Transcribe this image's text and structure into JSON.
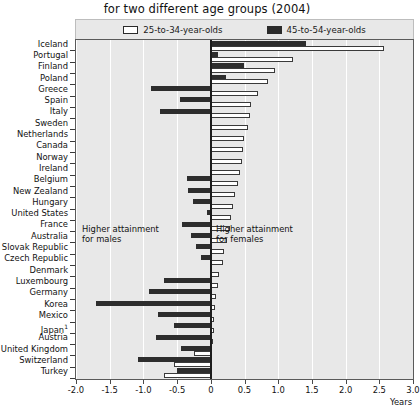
{
  "chart_data": {
    "type": "bar",
    "orientation": "horizontal",
    "title": "for two different age groups (2004)",
    "xlabel": "Years",
    "ylabel": "",
    "xlim": [
      -2.0,
      3.0
    ],
    "xticks": [
      -2.0,
      -1.5,
      -1.0,
      -0.5,
      0,
      0.5,
      1.0,
      1.5,
      2.0,
      2.5,
      3.0
    ],
    "xtick_labels": [
      "-2.0",
      "-1.5",
      "-1.0",
      "-0.5",
      "0",
      "0.5",
      "1.0",
      "1.5",
      "2.0",
      "2.5",
      "3.0"
    ],
    "grid": true,
    "legend_position": "top",
    "legend": [
      "25-to-34-year-olds",
      "45-to-54-year-olds"
    ],
    "annotations": [
      {
        "text_line1": "Higher attainment",
        "text_line2": "for males",
        "side": "left"
      },
      {
        "text_line1": "Higher attainment",
        "text_line2": "for females",
        "side": "right"
      }
    ],
    "categories": [
      "Iceland",
      "Portugal",
      "Finland",
      "Poland",
      "Greece",
      "Spain",
      "Italy",
      "Sweden",
      "Netherlands",
      "Canada",
      "Norway",
      "Ireland",
      "Belgium",
      "New Zealand",
      "Hungary",
      "United States",
      "France",
      "Australia",
      "Slovak Republic",
      "Czech Republic",
      "Denmark",
      "Luxembourg",
      "Germany",
      "Korea",
      "Mexico",
      "Japan¹",
      "Austria",
      "United Kingdom",
      "Switzerland",
      "Turkey"
    ],
    "series": [
      {
        "name": "25-to-34-year-olds",
        "color": "#ffffff",
        "values": [
          2.57,
          1.22,
          0.95,
          0.85,
          0.7,
          0.6,
          0.58,
          0.55,
          0.5,
          0.48,
          0.46,
          0.44,
          0.4,
          0.36,
          0.33,
          0.3,
          0.28,
          0.24,
          0.2,
          0.18,
          0.12,
          0.1,
          0.08,
          0.06,
          0.05,
          0.05,
          0.04,
          -0.25,
          -0.55,
          -0.7
        ]
      },
      {
        "name": "45-to-54-year-olds",
        "color": "#2d2d2d",
        "values": [
          1.41,
          0.1,
          0.5,
          0.22,
          -0.88,
          -0.46,
          -0.75,
          0.0,
          0.0,
          0.0,
          0.0,
          0.0,
          -0.35,
          -0.34,
          -0.27,
          -0.06,
          -0.42,
          -0.3,
          -0.22,
          -0.14,
          0.0,
          -0.7,
          -0.92,
          -1.7,
          -0.78,
          -0.55,
          -0.82,
          -0.44,
          -1.08,
          -0.5
        ]
      }
    ]
  }
}
